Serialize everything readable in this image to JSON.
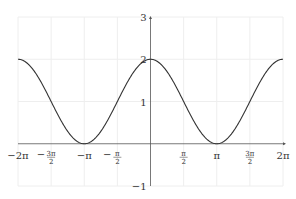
{
  "chart_data": {
    "type": "line",
    "title": "",
    "function": "y = 1 + cos(x)",
    "xlabel": "",
    "ylabel": "",
    "xlim": [
      -6.2832,
      6.2832
    ],
    "ylim": [
      -1,
      3
    ],
    "grid": true,
    "legend": null,
    "x_ticks": [
      {
        "value": -6.2832,
        "label": "−2π"
      },
      {
        "value": -4.7124,
        "label": "−3π/2"
      },
      {
        "value": -3.1416,
        "label": "−π"
      },
      {
        "value": -1.5708,
        "label": "−π/2"
      },
      {
        "value": 1.5708,
        "label": "π/2"
      },
      {
        "value": 3.1416,
        "label": "π"
      },
      {
        "value": 4.7124,
        "label": "3π/2"
      },
      {
        "value": 6.2832,
        "label": "2π"
      }
    ],
    "y_ticks": [
      {
        "value": -1,
        "label": "−1"
      },
      {
        "value": 1,
        "label": "1"
      },
      {
        "value": 2,
        "label": "2"
      },
      {
        "value": 3,
        "label": "3"
      }
    ],
    "series": [
      {
        "name": "1 + cos(x)",
        "color": "#333333",
        "x": [
          -6.2832,
          -4.7124,
          -3.1416,
          -1.5708,
          0,
          1.5708,
          3.1416,
          4.7124,
          6.2832
        ],
        "y": [
          2,
          1,
          0,
          1,
          2,
          1,
          0,
          1,
          2
        ]
      }
    ]
  },
  "colors": {
    "axis": "#555555",
    "grid": "#eeeeee",
    "curve": "#333333"
  }
}
